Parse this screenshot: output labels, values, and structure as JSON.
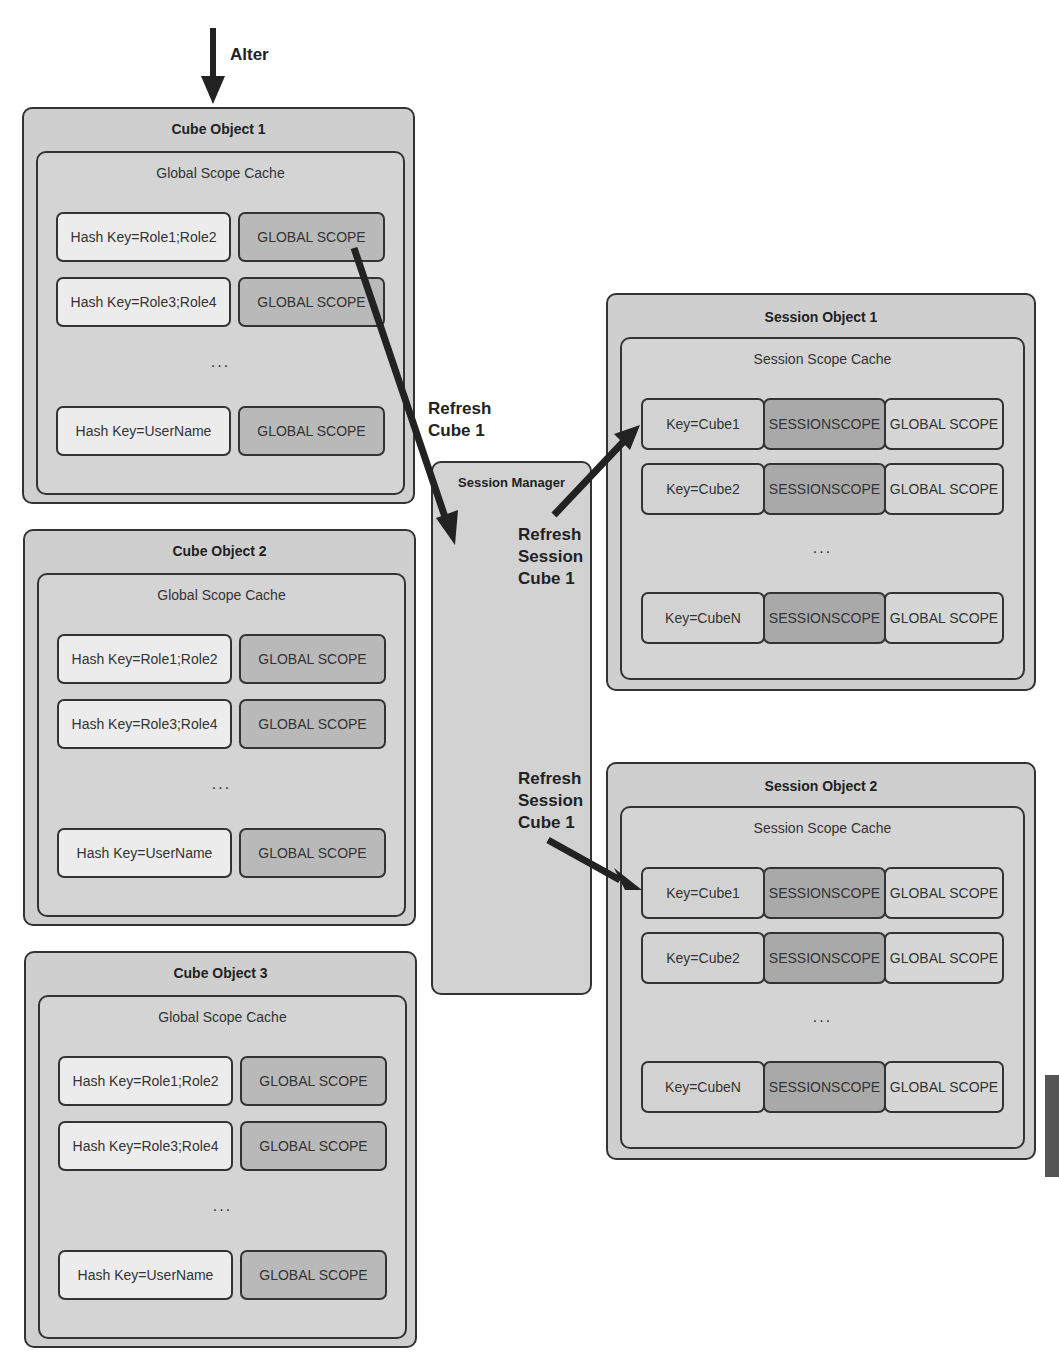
{
  "labels": {
    "alter": "Alter",
    "refresh_cube": [
      "Refresh",
      "Cube 1"
    ],
    "refresh_session_1": [
      "Refresh",
      "Session",
      "Cube 1"
    ],
    "refresh_session_2": [
      "Refresh",
      "Session",
      "Cube 1"
    ]
  },
  "cube_objects": [
    {
      "title": "Cube Object 1",
      "cache_title": "Global Scope Cache",
      "rows": [
        {
          "key": "Hash Key=Role1;Role2",
          "value": "GLOBAL SCOPE"
        },
        {
          "key": "Hash Key=Role3;Role4",
          "value": "GLOBAL SCOPE"
        },
        {
          "key": "Hash Key=UserName",
          "value": "GLOBAL SCOPE"
        }
      ],
      "ellipsis": "..."
    },
    {
      "title": "Cube Object 2",
      "cache_title": "Global Scope Cache",
      "rows": [
        {
          "key": "Hash Key=Role1;Role2",
          "value": "GLOBAL SCOPE"
        },
        {
          "key": "Hash Key=Role3;Role4",
          "value": "GLOBAL SCOPE"
        },
        {
          "key": "Hash Key=UserName",
          "value": "GLOBAL SCOPE"
        }
      ],
      "ellipsis": "..."
    },
    {
      "title": "Cube Object 3",
      "cache_title": "Global Scope Cache",
      "rows": [
        {
          "key": "Hash Key=Role1;Role2",
          "value": "GLOBAL SCOPE"
        },
        {
          "key": "Hash Key=Role3;Role4",
          "value": "GLOBAL SCOPE"
        },
        {
          "key": "Hash Key=UserName",
          "value": "GLOBAL SCOPE"
        }
      ],
      "ellipsis": "..."
    }
  ],
  "session_manager": {
    "title": "Session Manager"
  },
  "session_objects": [
    {
      "title": "Session Object 1",
      "cache_title": "Session Scope Cache",
      "rows": [
        {
          "key": "Key=Cube1",
          "session": "SESSIONSCOPE",
          "global": "GLOBAL SCOPE"
        },
        {
          "key": "Key=Cube2",
          "session": "SESSIONSCOPE",
          "global": "GLOBAL SCOPE"
        },
        {
          "key": "Key=CubeN",
          "session": "SESSIONSCOPE",
          "global": "GLOBAL SCOPE"
        }
      ],
      "ellipsis": "..."
    },
    {
      "title": "Session Object 2",
      "cache_title": "Session Scope Cache",
      "rows": [
        {
          "key": "Key=Cube1",
          "session": "SESSIONSCOPE",
          "global": "GLOBAL SCOPE"
        },
        {
          "key": "Key=Cube2",
          "session": "SESSIONSCOPE",
          "global": "GLOBAL SCOPE"
        },
        {
          "key": "Key=CubeN",
          "session": "SESSIONSCOPE",
          "global": "GLOBAL SCOPE"
        }
      ],
      "ellipsis": "..."
    }
  ],
  "colors": {
    "outer_fill": "#cfcfcf",
    "key_cell": "#ececec",
    "global_cell": "#b9b9b9",
    "session_scope_cell": "#a9a9a9",
    "stroke": "#333333",
    "arrow": "#222222"
  }
}
